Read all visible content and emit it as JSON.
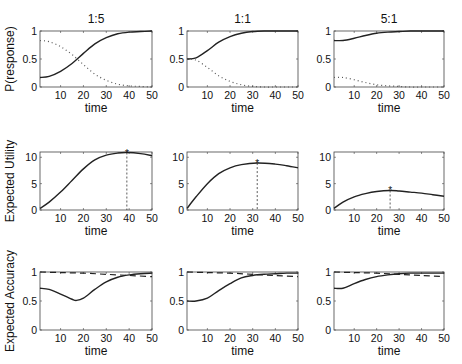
{
  "figure": {
    "columns": [
      "1:5",
      "1:1",
      "5:1"
    ],
    "row_ylabels": [
      "P(response)",
      "Expected Utility",
      "Expected Accuracy"
    ],
    "xlabel": "time"
  },
  "chart_data": [
    {
      "type": "line",
      "panel": "row1-col1",
      "title": "1:5",
      "xlabel": "time",
      "ylabel": "P(response)",
      "xlim": [
        1,
        50
      ],
      "ylim": [
        0,
        1
      ],
      "xticks": [
        10,
        20,
        30,
        40,
        50
      ],
      "yticks": [
        0,
        0.5,
        1
      ],
      "series": [
        {
          "name": "solid",
          "style": "solid",
          "x": [
            1,
            5,
            10,
            15,
            20,
            25,
            30,
            35,
            40,
            45,
            50
          ],
          "values": [
            0.17,
            0.19,
            0.28,
            0.42,
            0.6,
            0.77,
            0.88,
            0.95,
            0.98,
            0.99,
            1.0
          ]
        },
        {
          "name": "dotted",
          "style": "dotted",
          "x": [
            1,
            5,
            10,
            15,
            20,
            25,
            30,
            35,
            40,
            45,
            50
          ],
          "values": [
            0.83,
            0.81,
            0.72,
            0.58,
            0.4,
            0.23,
            0.12,
            0.05,
            0.02,
            0.01,
            0.0
          ]
        }
      ]
    },
    {
      "type": "line",
      "panel": "row1-col2",
      "title": "1:1",
      "xlabel": "time",
      "ylabel": "",
      "xlim": [
        1,
        50
      ],
      "ylim": [
        0,
        1
      ],
      "xticks": [
        10,
        20,
        30,
        40,
        50
      ],
      "yticks": [
        0,
        0.5,
        1
      ],
      "series": [
        {
          "name": "solid",
          "style": "solid",
          "x": [
            1,
            5,
            10,
            15,
            20,
            25,
            30,
            35,
            40,
            45,
            50
          ],
          "values": [
            0.5,
            0.52,
            0.65,
            0.8,
            0.9,
            0.96,
            0.99,
            1.0,
            1.0,
            1.0,
            1.0
          ]
        },
        {
          "name": "dotted",
          "style": "dotted",
          "x": [
            1,
            5,
            10,
            15,
            20,
            25,
            30,
            35,
            40,
            45,
            50
          ],
          "values": [
            0.5,
            0.48,
            0.35,
            0.2,
            0.1,
            0.04,
            0.01,
            0.0,
            0.0,
            0.0,
            0.0
          ]
        }
      ]
    },
    {
      "type": "line",
      "panel": "row1-col3",
      "title": "5:1",
      "xlabel": "time",
      "ylabel": "",
      "xlim": [
        1,
        50
      ],
      "ylim": [
        0,
        1
      ],
      "xticks": [
        10,
        20,
        30,
        40,
        50
      ],
      "yticks": [
        0,
        0.5,
        1
      ],
      "series": [
        {
          "name": "solid",
          "style": "solid",
          "x": [
            1,
            5,
            10,
            15,
            20,
            25,
            30,
            35,
            40,
            45,
            50
          ],
          "values": [
            0.83,
            0.83,
            0.87,
            0.92,
            0.96,
            0.98,
            0.99,
            1.0,
            1.0,
            1.0,
            1.0
          ]
        },
        {
          "name": "dotted",
          "style": "dotted",
          "x": [
            1,
            5,
            10,
            15,
            20,
            25,
            30,
            35,
            40,
            45,
            50
          ],
          "values": [
            0.17,
            0.17,
            0.13,
            0.08,
            0.04,
            0.02,
            0.01,
            0.0,
            0.0,
            0.0,
            0.0
          ]
        }
      ]
    },
    {
      "type": "line",
      "panel": "row2-col1",
      "title": "",
      "xlabel": "time",
      "ylabel": "Expected Utility",
      "xlim": [
        1,
        50
      ],
      "ylim": [
        0,
        11
      ],
      "xticks": [
        10,
        20,
        30,
        40,
        50
      ],
      "yticks": [
        0,
        5,
        10
      ],
      "series": [
        {
          "name": "solid",
          "style": "solid",
          "x": [
            1,
            5,
            10,
            15,
            20,
            25,
            30,
            35,
            39,
            45,
            50
          ],
          "values": [
            0.3,
            1.5,
            3.4,
            5.6,
            7.8,
            9.5,
            10.4,
            10.8,
            10.9,
            10.7,
            10.3
          ]
        }
      ],
      "annotations": [
        {
          "type": "max-marker",
          "x": 39,
          "y": 10.9,
          "dashed_vline": true
        }
      ]
    },
    {
      "type": "line",
      "panel": "row2-col2",
      "title": "",
      "xlabel": "time",
      "ylabel": "",
      "xlim": [
        1,
        50
      ],
      "ylim": [
        0,
        11
      ],
      "xticks": [
        10,
        20,
        30,
        40,
        50
      ],
      "yticks": [
        0,
        5,
        10
      ],
      "series": [
        {
          "name": "solid",
          "style": "solid",
          "x": [
            1,
            5,
            10,
            15,
            20,
            25,
            32,
            40,
            45,
            50
          ],
          "values": [
            0.3,
            2.5,
            5.0,
            6.9,
            8.0,
            8.6,
            8.9,
            8.7,
            8.4,
            8.0
          ]
        }
      ],
      "annotations": [
        {
          "type": "max-marker",
          "x": 32,
          "y": 8.9,
          "dashed_vline": true
        }
      ]
    },
    {
      "type": "line",
      "panel": "row2-col3",
      "title": "",
      "xlabel": "time",
      "ylabel": "",
      "xlim": [
        1,
        50
      ],
      "ylim": [
        0,
        11
      ],
      "xticks": [
        10,
        20,
        30,
        40,
        50
      ],
      "yticks": [
        0,
        5,
        10
      ],
      "series": [
        {
          "name": "solid",
          "style": "solid",
          "x": [
            1,
            5,
            10,
            15,
            20,
            26,
            30,
            35,
            40,
            45,
            50
          ],
          "values": [
            0.3,
            1.5,
            2.5,
            3.1,
            3.5,
            3.7,
            3.6,
            3.4,
            3.2,
            2.9,
            2.6
          ]
        }
      ],
      "annotations": [
        {
          "type": "max-marker",
          "x": 26,
          "y": 3.7,
          "dashed_vline": true
        }
      ]
    },
    {
      "type": "line",
      "panel": "row3-col1",
      "title": "",
      "xlabel": "time",
      "ylabel": "Expected Accuracy",
      "xlim": [
        1,
        50
      ],
      "ylim": [
        0,
        1
      ],
      "xticks": [
        10,
        20,
        30,
        40,
        50
      ],
      "yticks": [
        0,
        0.5,
        1
      ],
      "series": [
        {
          "name": "solid",
          "style": "solid",
          "x": [
            1,
            5,
            10,
            15,
            17,
            20,
            25,
            30,
            35,
            40,
            45,
            50
          ],
          "values": [
            0.72,
            0.7,
            0.62,
            0.53,
            0.51,
            0.55,
            0.7,
            0.83,
            0.91,
            0.95,
            0.97,
            0.98
          ]
        },
        {
          "name": "dashed",
          "style": "dashed",
          "x": [
            1,
            10,
            20,
            30,
            40,
            50
          ],
          "values": [
            1.0,
            0.99,
            0.98,
            0.96,
            0.94,
            0.92
          ]
        }
      ]
    },
    {
      "type": "line",
      "panel": "row3-col2",
      "title": "",
      "xlabel": "time",
      "ylabel": "",
      "xlim": [
        1,
        50
      ],
      "ylim": [
        0,
        1
      ],
      "xticks": [
        10,
        20,
        30,
        40,
        50
      ],
      "yticks": [
        0,
        0.5,
        1
      ],
      "series": [
        {
          "name": "solid",
          "style": "solid",
          "x": [
            1,
            5,
            10,
            15,
            20,
            25,
            30,
            35,
            40,
            45,
            50
          ],
          "values": [
            0.5,
            0.5,
            0.55,
            0.68,
            0.8,
            0.9,
            0.94,
            0.96,
            0.97,
            0.98,
            0.98
          ]
        },
        {
          "name": "dashed",
          "style": "dashed",
          "x": [
            1,
            10,
            20,
            30,
            40,
            50
          ],
          "values": [
            1.0,
            0.99,
            0.98,
            0.96,
            0.94,
            0.92
          ]
        }
      ]
    },
    {
      "type": "line",
      "panel": "row3-col3",
      "title": "",
      "xlabel": "time",
      "ylabel": "",
      "xlim": [
        1,
        50
      ],
      "ylim": [
        0,
        1
      ],
      "xticks": [
        10,
        20,
        30,
        40,
        50
      ],
      "yticks": [
        0,
        0.5,
        1
      ],
      "series": [
        {
          "name": "solid",
          "style": "solid",
          "x": [
            1,
            5,
            10,
            15,
            20,
            25,
            30,
            35,
            40,
            45,
            50
          ],
          "values": [
            0.72,
            0.72,
            0.8,
            0.87,
            0.92,
            0.95,
            0.97,
            0.98,
            0.98,
            0.98,
            0.98
          ]
        },
        {
          "name": "dashed",
          "style": "dashed",
          "x": [
            1,
            10,
            20,
            30,
            40,
            50
          ],
          "values": [
            1.0,
            0.99,
            0.98,
            0.96,
            0.94,
            0.92
          ]
        }
      ]
    }
  ]
}
